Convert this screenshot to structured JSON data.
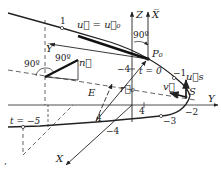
{
  "diagram": {
    "axes": {
      "z": "Z",
      "x_bar": "X̅",
      "y_bar": "Y̅",
      "y": "Y",
      "x": "X"
    },
    "points": {
      "p0": "P₀",
      "s": "S",
      "e": "E"
    },
    "vectors": {
      "u_eq_u0": "u⃗ = u⃗₀",
      "n": "n⃗",
      "u_s": "u⃗s",
      "v": "v⃗",
      "r0": "r⃗₀"
    },
    "angles": {
      "a1": "90º",
      "a2": "90º",
      "a3": "90º"
    },
    "params": {
      "t0": "t = 0",
      "t_neg5": "t = −5",
      "t1": "1",
      "t_neg1": "−1",
      "t_neg2": "−2",
      "t_neg3": "−3",
      "t_neg4": "−4"
    },
    "ticks": {
      "z_neg4": "−4",
      "y_4": "4",
      "x_4": "4"
    },
    "stray_mark": ","
  }
}
